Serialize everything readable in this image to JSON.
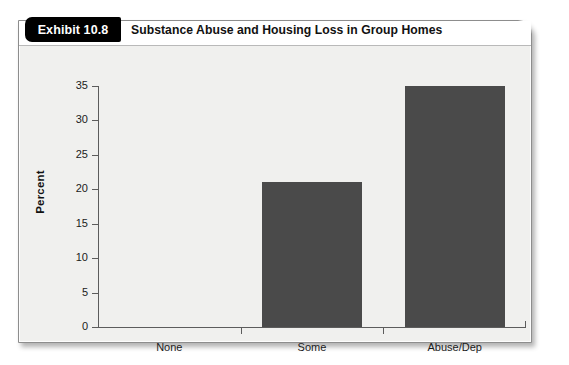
{
  "exhibit": {
    "tab_label": "Exhibit 10.8",
    "title": "Substance Abuse and Housing Loss in Group Homes"
  },
  "chart_data": {
    "type": "bar",
    "title": "Substance Abuse and Housing Loss in Group Homes",
    "categories": [
      "None",
      "Some",
      "Abuse/Dep"
    ],
    "values": [
      0,
      21,
      35
    ],
    "xlabel": "",
    "ylabel": "Percent",
    "ylim": [
      0,
      35
    ],
    "yticks": [
      0,
      5,
      10,
      15,
      20,
      25,
      30,
      35
    ],
    "ytick_labels": [
      "0",
      "5",
      "10",
      "15",
      "20",
      "25",
      "30",
      "35"
    ],
    "grid": false,
    "legend": "none",
    "bar_color": "#4a4a4a",
    "plot_background": "#f0f0ee",
    "axis_color": "#5c5c5c"
  }
}
